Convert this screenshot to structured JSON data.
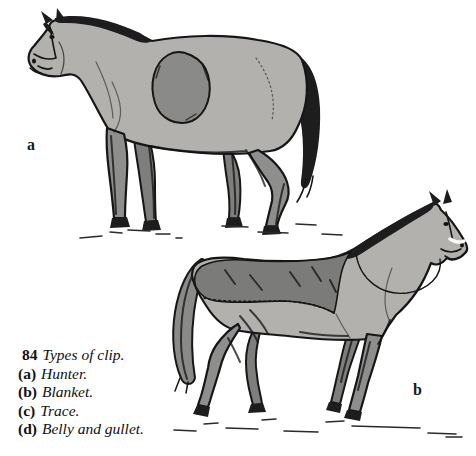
{
  "figure": {
    "number": "84",
    "title": "Types of clip.",
    "items": [
      {
        "key": "(a)",
        "label": "Hunter."
      },
      {
        "key": "(b)",
        "label": "Blanket."
      },
      {
        "key": "(c)",
        "label": "Trace."
      },
      {
        "key": "(d)",
        "label": "Belly and gullet."
      }
    ],
    "labels": {
      "a": "a",
      "b": "b"
    }
  },
  "colors": {
    "background": "#ffffff",
    "ink": "#161616",
    "body_light": "#b2b1ae",
    "saddle_patch": "#8a8a88",
    "blanket": "#7b7b79",
    "leg_gray": "#8e8e8c",
    "leg_far": "#7e7e7c",
    "tail_gray": "#8a8a88",
    "mane_dark": "#1d1d1d",
    "label_color": "#1a1a1a",
    "ground_ink": "#2a2a2a"
  }
}
